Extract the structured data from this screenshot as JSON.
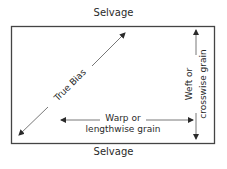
{
  "diagram": {
    "top_label": "Selvage",
    "bottom_label": "Selvage",
    "bias_label": "True Bias",
    "warp_label_line1": "Warp or",
    "warp_label_line2": "lengthwise grain",
    "weft_label_line1": "Weft or",
    "weft_label_line2": "crosswise grain"
  },
  "colors": {
    "line": "#3a3a3a",
    "text": "#2a2a2a",
    "background": "#ffffff"
  }
}
